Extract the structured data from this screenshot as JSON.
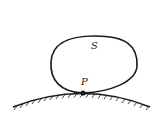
{
  "diagram": {
    "labels": {
      "region": "S",
      "point": "P"
    },
    "colors": {
      "stroke": "#1a1a1a",
      "background": "#ffffff"
    }
  }
}
